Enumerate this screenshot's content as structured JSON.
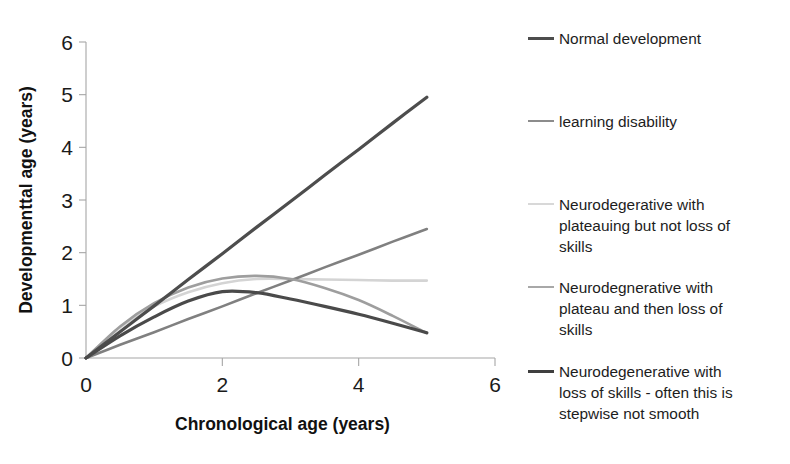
{
  "chart_data": {
    "type": "line",
    "title": "",
    "xlabel": "Chronological age (years)",
    "ylabel": "Developmenttal age (years)",
    "xlim": [
      0,
      6
    ],
    "ylim": [
      0,
      6
    ],
    "xticks": [
      "0",
      "2",
      "4",
      "6"
    ],
    "yticks": [
      "0",
      "1",
      "2",
      "3",
      "4",
      "5",
      "6"
    ],
    "xtick_values": [
      0,
      2,
      4,
      6
    ],
    "ytick_values": [
      0,
      1,
      2,
      3,
      4,
      5,
      6
    ],
    "grid": false,
    "legend_position": "right",
    "x": [
      0,
      0.5,
      1,
      1.5,
      2,
      2.5,
      3,
      3.5,
      4,
      4.5,
      5
    ],
    "series": [
      {
        "name": "Normal development",
        "color": "#4d4d4d",
        "width": 3.2,
        "values": [
          0,
          0.5,
          0.99,
          1.49,
          1.98,
          2.48,
          2.97,
          3.47,
          3.96,
          4.46,
          4.95
        ]
      },
      {
        "name": "learning disability",
        "color": "#808080",
        "width": 2.6,
        "values": [
          0,
          0.25,
          0.49,
          0.74,
          0.98,
          1.23,
          1.47,
          1.72,
          1.96,
          2.21,
          2.45
        ]
      },
      {
        "name": "Neurodegerative with\nplateauing but not loss of\nskills",
        "color": "#d4d4d4",
        "width": 2.6,
        "values": [
          0,
          0.58,
          0.98,
          1.25,
          1.42,
          1.5,
          1.5,
          1.49,
          1.48,
          1.47,
          1.47
        ]
      },
      {
        "name": "Neurodegnerative with\nplateau and then loss of\nskills",
        "color": "#9e9e9e",
        "width": 2.6,
        "values": [
          0,
          0.6,
          1.04,
          1.34,
          1.51,
          1.56,
          1.5,
          1.33,
          1.1,
          0.8,
          0.47
        ]
      },
      {
        "name": "Neurodegenerative with\nloss of skills - often this is\nstepwise not smooth",
        "color": "#4a4a4a",
        "width": 3.2,
        "values": [
          0,
          0.42,
          0.78,
          1.08,
          1.26,
          1.24,
          1.12,
          0.98,
          0.83,
          0.66,
          0.48
        ]
      }
    ]
  },
  "legend": {
    "items": [
      {
        "label": "Normal development",
        "color": "#4d4d4d",
        "thickness": "3px",
        "top": 28
      },
      {
        "label": "learning disability",
        "color": "#8c8c8c",
        "thickness": "2.4px",
        "top": 111
      },
      {
        "label": "Neurodegerative with\nplateauing but not loss of\nskills",
        "color": "#d8d8d8",
        "thickness": "2.2px",
        "top": 194
      },
      {
        "label": "Neurodegnerative with\nplateau and then loss of\nskills",
        "color": "#a8a8a8",
        "thickness": "2.4px",
        "top": 277
      },
      {
        "label": "Neurodegenerative with\nloss of skills - often this is\nstepwise not smooth",
        "color": "#3f3f3f",
        "thickness": "3.2px",
        "top": 361
      }
    ]
  }
}
